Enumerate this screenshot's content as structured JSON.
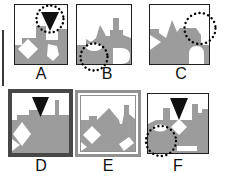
{
  "figure": {
    "background": "#ffffff",
    "colors": {
      "scene_gray": "#9c9c9c",
      "cue_black": "#111111",
      "frame_thin": "#1f1f1f",
      "frame_thick_dark": "#474747",
      "frame_double_gray": "#919191",
      "probe_dot_black": "#000000"
    },
    "icons": {
      "cue_triangle": "▼",
      "probe_circle": "◌"
    },
    "panels": [
      {
        "label": "A",
        "frame": "thin",
        "has_cue_triangle": true,
        "has_probe_circle": true,
        "probe_position": "top-center"
      },
      {
        "label": "B",
        "frame": "thin",
        "has_cue_triangle": false,
        "has_probe_circle": true,
        "probe_position": "bottom-left"
      },
      {
        "label": "C",
        "frame": "thin",
        "has_cue_triangle": false,
        "has_probe_circle": true,
        "probe_position": "top-right"
      },
      {
        "label": "D",
        "frame": "thick-dark",
        "has_cue_triangle": true,
        "has_probe_circle": false,
        "probe_position": ""
      },
      {
        "label": "E",
        "frame": "double",
        "has_cue_triangle": false,
        "has_probe_circle": false,
        "probe_position": ""
      },
      {
        "label": "F",
        "frame": "thin",
        "has_cue_triangle": true,
        "has_probe_circle": true,
        "probe_position": "bottom-left"
      }
    ]
  }
}
